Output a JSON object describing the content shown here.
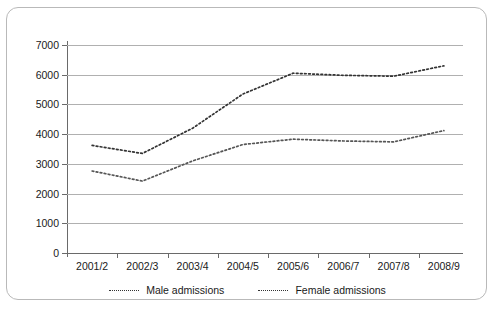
{
  "chart_data": {
    "type": "line",
    "title": "",
    "xlabel": "",
    "ylabel": "",
    "categories": [
      "2001/2",
      "2002/3",
      "2003/4",
      "2004/5",
      "2005/6",
      "2006/7",
      "2007/8",
      "2008/9"
    ],
    "ylim": [
      0,
      7000
    ],
    "y_ticks": [
      0,
      1000,
      2000,
      3000,
      4000,
      5000,
      6000,
      7000
    ],
    "y_tick_labels": [
      "0",
      "1000",
      "2000",
      "3000",
      "4000",
      "5000",
      "6000",
      "7000"
    ],
    "grid": true,
    "legend_position": "bottom",
    "series": [
      {
        "name": "Male admissions",
        "style": "dotted",
        "color": "#333333",
        "values": [
          3620,
          3350,
          4200,
          5350,
          6050,
          5980,
          5950,
          6300
        ]
      },
      {
        "name": "Female admissions",
        "style": "dotted",
        "color": "#555555",
        "values": [
          2760,
          2420,
          3100,
          3650,
          3830,
          3770,
          3740,
          4120
        ]
      }
    ]
  },
  "legend": {
    "items": [
      {
        "label": "Male admissions"
      },
      {
        "label": "Female admissions"
      }
    ]
  }
}
